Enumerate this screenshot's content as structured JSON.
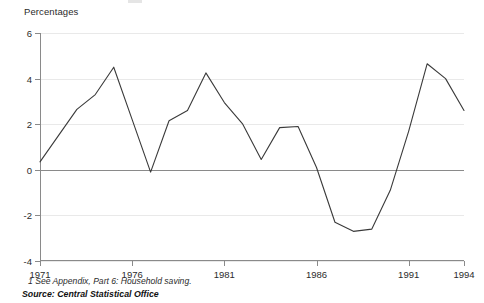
{
  "header": {
    "axis_title": "Percentages"
  },
  "notes": {
    "footnote": "1 See Appendix, Part 6: Household saving.",
    "source": "Source: Central Statistical Office"
  },
  "colors": {
    "line": "#3a3a3a",
    "axis": "#8a8a8a",
    "grid": "#e9e9e9",
    "text": "#2b2b2b",
    "background": "#ffffff"
  },
  "chart_data": {
    "type": "line",
    "title": "",
    "subtitle": "",
    "xlabel": "",
    "ylabel": "Percentages",
    "xlim": [
      1971,
      1994
    ],
    "ylim": [
      -4,
      6
    ],
    "grid": true,
    "legend": "none",
    "yticks": [
      6,
      4,
      2,
      0,
      -2,
      -4
    ],
    "ytick_labels": [
      "6",
      "4",
      "2",
      "0",
      "-2",
      "-4"
    ],
    "xticks": [
      1971,
      1976,
      1981,
      1986,
      1991,
      1994
    ],
    "xtick_labels": [
      "1971",
      "1976",
      "1981",
      "1986",
      "1991",
      "1994"
    ],
    "x": [
      1971,
      1972,
      1973,
      1974,
      1975,
      1976,
      1977,
      1978,
      1979,
      1980,
      1981,
      1982,
      1983,
      1984,
      1985,
      1986,
      1987,
      1988,
      1989,
      1990,
      1991,
      1992,
      1993,
      1994
    ],
    "values": [
      0.35,
      1.5,
      2.65,
      3.3,
      4.5,
      2.2,
      -0.1,
      2.15,
      2.6,
      4.25,
      2.95,
      2.0,
      0.45,
      1.85,
      1.9,
      0.1,
      -2.3,
      -2.7,
      -2.6,
      -0.9,
      1.7,
      4.65,
      4.0,
      2.6
    ],
    "series": [
      {
        "name": "Household saving",
        "values": [
          0.35,
          1.5,
          2.65,
          3.3,
          4.5,
          2.2,
          -0.1,
          2.15,
          2.6,
          4.25,
          2.95,
          2.0,
          0.45,
          1.85,
          1.9,
          0.1,
          -2.3,
          -2.7,
          -2.6,
          -0.9,
          1.7,
          4.65,
          4.0,
          2.6
        ]
      }
    ]
  }
}
